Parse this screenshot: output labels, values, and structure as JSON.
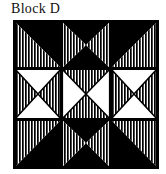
{
  "figure": {
    "caption": "Block D",
    "type": "quilt-block-diagram"
  },
  "block": {
    "name": "Block D",
    "grid_rows": 3,
    "grid_cols": 3,
    "border": true,
    "colors": {
      "solid": "#000000",
      "background": "#ffffff",
      "stripe_ink": "#000000",
      "outline": "#000000"
    },
    "fills": {
      "solid_label": "solid black",
      "striped_label": "vertical stripes",
      "white_label": "plain white"
    },
    "stripe": {
      "period_px": 3,
      "line_width_px": 1.6,
      "orientation": "vertical"
    },
    "cells": [
      {
        "name": "top-left",
        "row": 0,
        "col": 0,
        "pattern": "half-square-triangle",
        "triangles": [
          {
            "position": "upper-right",
            "fill": "solid"
          },
          {
            "position": "lower-left",
            "fill": "striped"
          }
        ]
      },
      {
        "name": "top-center",
        "row": 0,
        "col": 1,
        "pattern": "hourglass",
        "triangles": [
          {
            "position": "top",
            "fill": "solid"
          },
          {
            "position": "bottom",
            "fill": "solid"
          },
          {
            "position": "left",
            "fill": "striped"
          },
          {
            "position": "right",
            "fill": "striped"
          }
        ]
      },
      {
        "name": "top-right",
        "row": 0,
        "col": 2,
        "pattern": "half-square-triangle",
        "triangles": [
          {
            "position": "upper-left",
            "fill": "solid"
          },
          {
            "position": "lower-right",
            "fill": "striped"
          }
        ]
      },
      {
        "name": "middle-left",
        "row": 1,
        "col": 0,
        "pattern": "hourglass",
        "triangles": [
          {
            "position": "top",
            "fill": "white"
          },
          {
            "position": "bottom",
            "fill": "white"
          },
          {
            "position": "left",
            "fill": "striped"
          },
          {
            "position": "right",
            "fill": "striped"
          }
        ]
      },
      {
        "name": "center",
        "row": 1,
        "col": 1,
        "pattern": "hourglass",
        "triangles": [
          {
            "position": "top",
            "fill": "striped"
          },
          {
            "position": "bottom",
            "fill": "striped"
          },
          {
            "position": "left",
            "fill": "white"
          },
          {
            "position": "right",
            "fill": "white"
          }
        ]
      },
      {
        "name": "middle-right",
        "row": 1,
        "col": 2,
        "pattern": "hourglass",
        "triangles": [
          {
            "position": "top",
            "fill": "white"
          },
          {
            "position": "bottom",
            "fill": "white"
          },
          {
            "position": "left",
            "fill": "striped"
          },
          {
            "position": "right",
            "fill": "striped"
          }
        ]
      },
      {
        "name": "bottom-left",
        "row": 2,
        "col": 0,
        "pattern": "half-square-triangle",
        "triangles": [
          {
            "position": "upper-left",
            "fill": "striped"
          },
          {
            "position": "lower-right",
            "fill": "solid"
          }
        ]
      },
      {
        "name": "bottom-center",
        "row": 2,
        "col": 1,
        "pattern": "hourglass",
        "triangles": [
          {
            "position": "top",
            "fill": "solid"
          },
          {
            "position": "bottom",
            "fill": "solid"
          },
          {
            "position": "left",
            "fill": "striped"
          },
          {
            "position": "right",
            "fill": "striped"
          }
        ]
      },
      {
        "name": "bottom-right",
        "row": 2,
        "col": 2,
        "pattern": "half-square-triangle",
        "triangles": [
          {
            "position": "upper-right",
            "fill": "striped"
          },
          {
            "position": "lower-left",
            "fill": "solid"
          }
        ]
      }
    ]
  }
}
